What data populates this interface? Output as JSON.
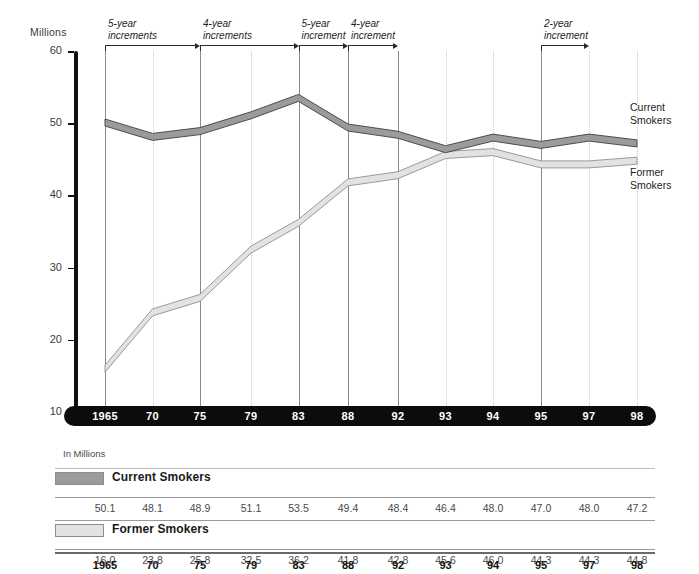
{
  "chart_data": {
    "type": "line",
    "title": "",
    "xlabel": "",
    "ylabel": "Millions",
    "ylim": [
      10,
      60
    ],
    "yticks": [
      10,
      20,
      30,
      40,
      50,
      60
    ],
    "grid": true,
    "legend_position": "right-of-plot",
    "categories": [
      "1965",
      "70",
      "75",
      "79",
      "83",
      "88",
      "92",
      "93",
      "94",
      "95",
      "97",
      "98"
    ],
    "series": [
      {
        "name": "Current Smokers",
        "color": "#9b9b9b",
        "values": [
          50.1,
          48.1,
          48.9,
          51.1,
          53.5,
          49.4,
          48.4,
          46.4,
          48.0,
          47.0,
          48.0,
          47.2
        ]
      },
      {
        "name": "Former Smokers",
        "color": "#e2e2e2",
        "values": [
          16.0,
          23.8,
          25.8,
          32.5,
          36.2,
          41.8,
          42.8,
          45.6,
          46.0,
          44.3,
          44.3,
          44.8
        ]
      }
    ],
    "annotations": [
      {
        "text_line1": "5-year",
        "text_line2": "increments",
        "from": "1965",
        "to": "75"
      },
      {
        "text_line1": "4-year",
        "text_line2": "increments",
        "from": "75",
        "to": "83"
      },
      {
        "text_line1": "5-year",
        "text_line2": "increment",
        "from": "83",
        "to": "88"
      },
      {
        "text_line1": "4-year",
        "text_line2": "increment",
        "from": "88",
        "to": "92"
      },
      {
        "text_line1": "2-year",
        "text_line2": "increment",
        "from": "95",
        "to": "97"
      }
    ]
  },
  "axis": {
    "y_title": "Millions",
    "y_ticks": [
      "60",
      "50",
      "40",
      "30",
      "20",
      "10"
    ],
    "x_labels": [
      "1965",
      "70",
      "75",
      "79",
      "83",
      "88",
      "92",
      "93",
      "94",
      "95",
      "97",
      "98"
    ]
  },
  "callouts": {
    "current_line1": "Current",
    "current_line2": "Smokers",
    "former_line1": "Former",
    "former_line2": "Smokers"
  },
  "table": {
    "units_label": "In Millions",
    "rows": [
      {
        "name": "Current Smokers",
        "values": [
          "50.1",
          "48.1",
          "48.9",
          "51.1",
          "53.5",
          "49.4",
          "48.4",
          "46.4",
          "48.0",
          "47.0",
          "48.0",
          "47.2"
        ]
      },
      {
        "name": "Former Smokers",
        "values": [
          "16.0",
          "23.8",
          "25.8",
          "32.5",
          "36.2",
          "41.8",
          "42.8",
          "45.6",
          "46.0",
          "44.3",
          "44.3",
          "44.8"
        ]
      }
    ],
    "year_row": [
      "1965",
      "70",
      "75",
      "79",
      "83",
      "88",
      "92",
      "93",
      "94",
      "95",
      "97",
      "98"
    ]
  },
  "colors": {
    "current_fill": "#9b9b9b",
    "current_stroke": "#4d4d4d",
    "former_fill": "#e2e2e2",
    "former_stroke": "#9a9a9a",
    "axis_bar": "#0c0c0c",
    "grid_solid": "#8a8a8a",
    "grid_dotted": "#c9c9c9"
  }
}
